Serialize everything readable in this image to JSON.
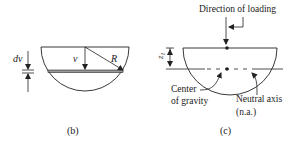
{
  "figure_b": {
    "caption": "(b)",
    "labels": {
      "dv": "dv",
      "v": "v",
      "R": "R"
    }
  },
  "figure_c": {
    "caption": "(c)",
    "labels": {
      "direction": "Direction of loading",
      "z1": "z",
      "z1_sub": "1",
      "center_line1": "Center",
      "center_line2": "of gravity",
      "neutral_line1": "Neutral axis",
      "neutral_line2": "(n.a.)"
    }
  },
  "colors": {
    "stroke": "#222222",
    "strip_fill": "#999999"
  }
}
